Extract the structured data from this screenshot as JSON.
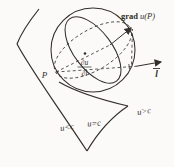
{
  "figure": {
    "background": "#fbfaf8",
    "stroke_color": "#332f2b",
    "labels": {
      "gradient_prefix": "grad",
      "gradient_argument": "u(P)",
      "point": "P",
      "direction": "l",
      "derivative_numerator": "∂u",
      "derivative_denominator": "∂l",
      "region_less": "u<c",
      "region_equal": "u=c",
      "region_greater": "u>c"
    }
  }
}
